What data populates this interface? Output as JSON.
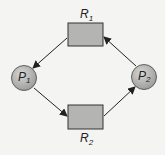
{
  "diagram": {
    "type": "resource-allocation-graph",
    "processes": [
      {
        "id": "P1",
        "name": "P",
        "sub": "1"
      },
      {
        "id": "P2",
        "name": "P",
        "sub": "2"
      }
    ],
    "resources": [
      {
        "id": "R1",
        "name": "R",
        "sub": "1"
      },
      {
        "id": "R2",
        "name": "R",
        "sub": "2"
      }
    ],
    "edges": [
      {
        "from": "R1",
        "to": "P1"
      },
      {
        "from": "P1",
        "to": "R2"
      },
      {
        "from": "R2",
        "to": "P2"
      },
      {
        "from": "P2",
        "to": "R1"
      }
    ],
    "colors": {
      "node_fill": "#b0b0ae",
      "stroke": "#333333"
    }
  }
}
